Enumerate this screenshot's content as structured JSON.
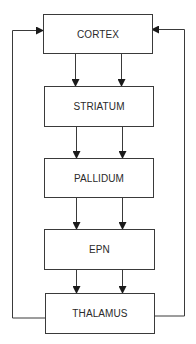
{
  "diagram": {
    "type": "flowchart",
    "nodes": [
      {
        "id": "cortex",
        "label": "CORTEX"
      },
      {
        "id": "striatum",
        "label": "STRIATUM"
      },
      {
        "id": "pallidum",
        "label": "PALLIDUM"
      },
      {
        "id": "epn",
        "label": "EPN"
      },
      {
        "id": "thalamus",
        "label": "THALAMUS"
      }
    ],
    "edges": [
      {
        "from": "cortex",
        "to": "striatum",
        "count": 2
      },
      {
        "from": "striatum",
        "to": "pallidum",
        "count": 2
      },
      {
        "from": "pallidum",
        "to": "epn",
        "count": 2
      },
      {
        "from": "epn",
        "to": "thalamus",
        "count": 2
      },
      {
        "from": "thalamus",
        "to": "cortex",
        "side": "left",
        "type": "feedback"
      },
      {
        "from": "thalamus",
        "to": "cortex",
        "side": "right",
        "type": "feedback"
      }
    ],
    "colors": {
      "line": "#3a3a3a",
      "text": "#2a2a2a",
      "background": "#ffffff"
    }
  }
}
